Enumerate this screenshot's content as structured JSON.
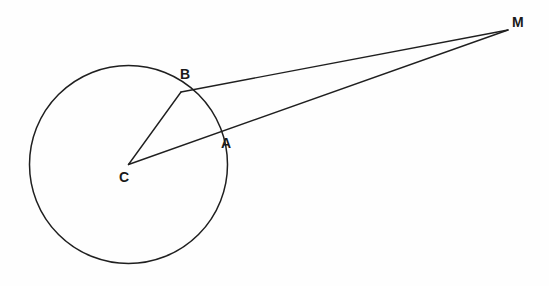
{
  "figure": {
    "background_color": "#fefefe",
    "stroke_color": "#1f1f1f",
    "label_color": "#1a1a1a",
    "width": 549,
    "height": 286
  },
  "labels": {
    "point_a": "A",
    "point_b": "B",
    "point_c": "C",
    "point_m": "M"
  },
  "chart_data": {
    "type": "diagram",
    "coordinate_system": "pixels, origin top-left",
    "points": [
      {
        "name": "C",
        "role": "circle-center",
        "x": 128.5,
        "y": 164.5,
        "label": "C",
        "label_x": 119,
        "label_y": 170
      },
      {
        "name": "B",
        "role": "tangent-point-on-circle",
        "x": 181,
        "y": 92,
        "label": "B",
        "label_x": 180,
        "label_y": 67
      },
      {
        "name": "A",
        "role": "secant-intersection-on-circle",
        "x": 215,
        "y": 137,
        "label": "A",
        "label_x": 221,
        "label_y": 136
      },
      {
        "name": "M",
        "role": "external-point",
        "x": 508,
        "y": 30,
        "label": "M",
        "label_x": 512,
        "label_y": 15
      }
    ],
    "circle": {
      "center": [
        128.5,
        164.5
      ],
      "radius": 99,
      "stroke": "#1f1f1f",
      "fill": "none"
    },
    "segments": [
      {
        "name": "CB",
        "from": "C",
        "to": "B",
        "description": "radius to tangent point"
      },
      {
        "name": "BM",
        "from": "B",
        "to": "M",
        "description": "tangent segment from B to external point M"
      },
      {
        "name": "CM",
        "from": "C",
        "to": "M",
        "description": "line from center through A to external point M"
      }
    ],
    "axis_ranges": {
      "x": [
        0,
        549
      ],
      "y": [
        0,
        286
      ]
    },
    "grid": false,
    "legend": false
  }
}
